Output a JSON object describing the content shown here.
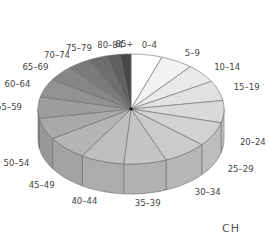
{
  "chart_data": {
    "type": "pie",
    "style": "3d",
    "title": "",
    "country_label": "CH",
    "categories": [
      "0-4",
      "5-9",
      "10-14",
      "15-19",
      "20-24",
      "25-29",
      "30-34",
      "35-39",
      "40-44",
      "45-49",
      "50-54",
      "55-59",
      "60-64",
      "65-69",
      "70-74",
      "75-79",
      "80-84",
      "85+"
    ],
    "values": [
      5.4,
      5.6,
      5.6,
      5.9,
      6.5,
      7.2,
      7.6,
      7.4,
      7.5,
      7.2,
      6.3,
      6.3,
      5.4,
      4.6,
      3.9,
      3.3,
      2.3,
      1.9
    ],
    "colors": [
      "#ffffff",
      "#f2f2f2",
      "#e9e9e9",
      "#e1e1e1",
      "#d9d9d9",
      "#d2d2d2",
      "#cbcbcb",
      "#c5c5c5",
      "#bfbfbf",
      "#b5b5b5",
      "#a9a9a9",
      "#9d9d9d",
      "#929292",
      "#868686",
      "#7a7a7a",
      "#6e6e6e",
      "#606060",
      "#4a4a4a"
    ],
    "direction": "clockwise from 12 o'clock",
    "legend": "labels placed around slices"
  },
  "geometry": {
    "cx": 131,
    "cy": 109,
    "rx": 93,
    "ry": 55,
    "depth": 30
  }
}
